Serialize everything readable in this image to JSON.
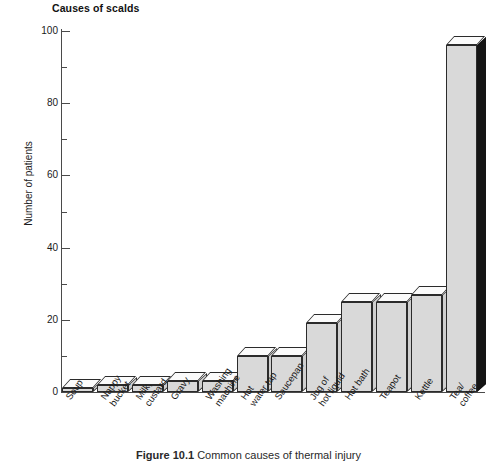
{
  "chart_data": {
    "type": "bar",
    "title": "Causes of scalds",
    "xlabel": "",
    "ylabel": "Number of patients",
    "ylim": [
      0,
      100
    ],
    "ytick_labels": [
      "0",
      "20",
      "40",
      "60",
      "80",
      "100"
    ],
    "ytick_values": [
      0,
      20,
      40,
      60,
      80,
      100
    ],
    "yminor_values": [
      10,
      30,
      50,
      70,
      90
    ],
    "grid": false,
    "legend": "none",
    "categories": [
      "Soup",
      "Nappy\nbucket",
      "Milk,\ncustard",
      "Gravy",
      "Washing\nmachine",
      "Hot\nwater tap",
      "Saucepan",
      "Jug of\nhot liquid",
      "Hot bath",
      "Teapot",
      "Kettle",
      "Tea/\ncoffee"
    ],
    "values": [
      1,
      2,
      2,
      3,
      3,
      10,
      10,
      19,
      25,
      25,
      27,
      96
    ],
    "bar_style": "3d-block",
    "highlight_index": 11
  },
  "figure": {
    "caption_number": "Figure 10.1",
    "caption_text": "Common causes of thermal injury"
  }
}
